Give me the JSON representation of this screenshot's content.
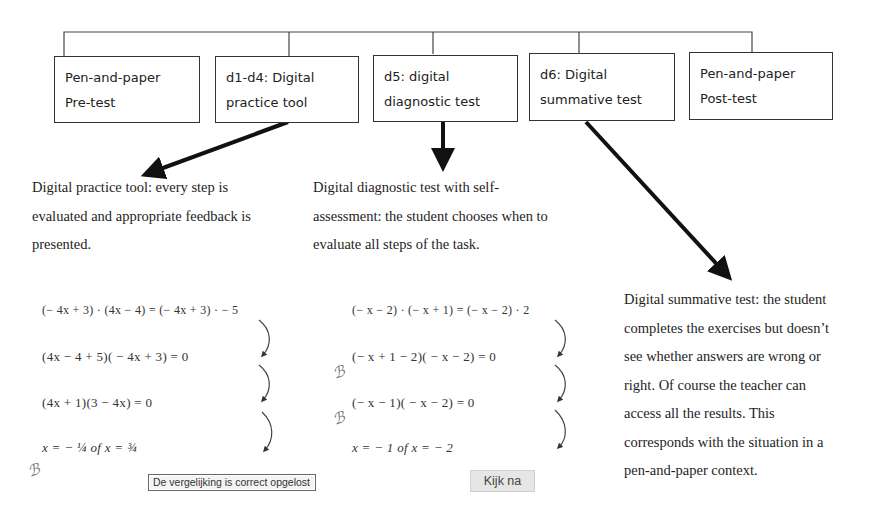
{
  "diagram": {
    "boxes": [
      {
        "id": "pretest",
        "line1": "Pen-and-paper",
        "line2": "Pre-test"
      },
      {
        "id": "practice",
        "line1": "d1-d4: Digital",
        "line2": "practice tool"
      },
      {
        "id": "diagnostic",
        "line1": "d5: digital",
        "line2": "diagnostic test"
      },
      {
        "id": "summative",
        "line1": "d6: Digital",
        "line2": "summative test"
      },
      {
        "id": "posttest",
        "line1": "Pen-and-paper",
        "line2": "Post-test"
      }
    ],
    "descriptions": {
      "practice": [
        "Digital practice tool: every step is",
        "evaluated and appropriate feedback is",
        "presented."
      ],
      "diagnostic": [
        "Digital diagnostic test with self-",
        "assessment: the student chooses when to",
        "evaluate all steps of the task."
      ],
      "summative": [
        "Digital summative test: the student",
        "completes the exercises but doesn’t",
        "see whether answers are wrong or",
        "right. Of course the teacher can",
        "access all the results. This",
        "corresponds with the situation in a",
        "pen-and-paper context."
      ]
    },
    "practice_example": {
      "steps": [
        "(− 4x + 3) · (4x − 4) = (− 4x + 3) · − 5",
        "(4x − 4 + 5)( − 4x + 3) = 0",
        "(4x + 1)(3 − 4x) = 0",
        "x = − ¼  of  x = ¾"
      ],
      "feedback": "De vergelijking is correct opgelost"
    },
    "diagnostic_example": {
      "steps": [
        "(− x − 2) · (− x + 1) = (− x − 2) · 2",
        "(− x + 1 − 2)( − x − 2) = 0",
        "(− x − 1)( − x − 2) = 0",
        "x = − 1  of  x = − 2"
      ],
      "check_button": "Kijk na"
    },
    "icons": {
      "step_arrow": "curved-down-arrow",
      "status_mark": "squiggle-mark"
    }
  }
}
